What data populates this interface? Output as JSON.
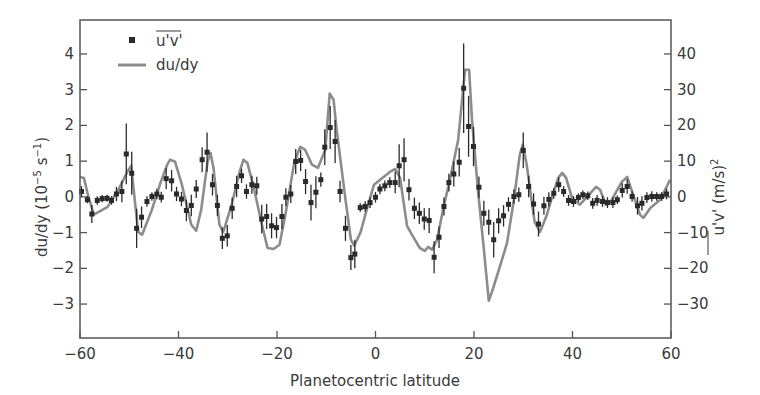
{
  "chart_data": {
    "type": "line",
    "title": "",
    "xlabel": "Planetocentric latitude",
    "ylabel": "du/dy (10^-5 s^-1)",
    "ylabel_right": "u'v' (m/s)^2",
    "xlim": [
      -60,
      60
    ],
    "ylim": [
      -3.95,
      4.95
    ],
    "ylim_right": [
      -39.5,
      49.5
    ],
    "xticks": [
      -60,
      -40,
      -20,
      0,
      20,
      40,
      60
    ],
    "yticks": [
      -3,
      -2,
      -1,
      0,
      1,
      2,
      3,
      4
    ],
    "yticks_right": [
      -30,
      -20,
      -10,
      0,
      10,
      20,
      30,
      40
    ],
    "grid": false,
    "legend_position": "upper left",
    "legend": [
      {
        "label": "u'v'",
        "overline": true,
        "marker": "square",
        "color": "#2a2a2a"
      },
      {
        "label": "du/dy",
        "marker": "line",
        "color": "#8c8c8c"
      }
    ],
    "series": [
      {
        "name": "du/dy",
        "axis": "left",
        "style": "line",
        "color": "#8c8c8c",
        "x": [
          -60,
          -59.2,
          -58.4,
          -57.2,
          -54.4,
          -52,
          -50.4,
          -49.6,
          -48.2,
          -47.4,
          -45.4,
          -43.6,
          -42.3,
          -41.7,
          -40.7,
          -39.3,
          -37.4,
          -36.4,
          -35.4,
          -34.1,
          -33.5,
          -32.9,
          -31.7,
          -30.9,
          -29.2,
          -27.6,
          -26.8,
          -26,
          -24.6,
          -23.1,
          -21.9,
          -20.7,
          -19.5,
          -18.3,
          -16.5,
          -15.3,
          -14.3,
          -12.9,
          -11.7,
          -10.2,
          -9.3,
          -8.5,
          -7.9,
          -6.1,
          -5,
          -4.3,
          -3,
          -1.9,
          -0.3,
          2.9,
          4,
          5,
          6.4,
          7.4,
          9,
          10,
          10.7,
          11.5,
          12.5,
          13.7,
          15.1,
          16.8,
          18.2,
          19,
          19.6,
          20.8,
          22,
          23,
          23.9,
          25.3,
          26.7,
          28.1,
          29.3,
          29.9,
          30.7,
          32.3,
          33.4,
          34.8,
          36,
          37.1,
          37.9,
          38.7,
          39.9,
          41.5,
          44.8,
          45.6,
          46.8,
          48,
          50,
          51.1,
          52.3,
          53.7,
          54.4,
          55.8,
          57.8,
          59,
          59.8
        ],
        "y": [
          0.56,
          0.53,
          0.06,
          -0.5,
          -0.28,
          0.25,
          0.7,
          0.87,
          -0.98,
          -1.06,
          -0.36,
          0.42,
          0.9,
          1.04,
          0.98,
          0.34,
          -0.78,
          -0.95,
          -0.36,
          0.98,
          1.23,
          0.81,
          -0.78,
          -0.98,
          -0.22,
          0.7,
          1.04,
          0.95,
          0.2,
          -0.76,
          -1.43,
          -1.46,
          -1.34,
          -0.5,
          0.95,
          1.4,
          1.32,
          0.9,
          0.81,
          1.32,
          2.89,
          2.72,
          1.88,
          -0.08,
          -1.2,
          -1.37,
          -0.98,
          -0.42,
          0.34,
          0.7,
          0.78,
          0.53,
          -0.81,
          -1.06,
          -1.43,
          -1.51,
          -1.4,
          -1.48,
          -1.2,
          -0.36,
          0.48,
          1.6,
          3.56,
          3.56,
          2.16,
          0.2,
          -1.48,
          -2.91,
          -2.55,
          -1.93,
          -1.29,
          -0.08,
          1.18,
          1.46,
          0.9,
          -0.7,
          -0.98,
          -0.5,
          0.06,
          0.53,
          0.67,
          0.53,
          -0.03,
          -0.22,
          0.28,
          0.2,
          -0.22,
          -0.08,
          0.42,
          0.56,
          0.06,
          -0.5,
          -0.59,
          -0.31,
          -0.08,
          0.25,
          0.48
        ]
      },
      {
        "name": "u'v'",
        "axis": "left",
        "style": "scatter-errorbar",
        "color": "#2a2a2a",
        "x": [
          -59.7,
          -58.5,
          -57.6,
          -56.5,
          -55.5,
          -54.5,
          -53.6,
          -52.6,
          -51.5,
          -50.6,
          -49.5,
          -48.5,
          -47.5,
          -46.4,
          -45.4,
          -44.4,
          -43.5,
          -42.5,
          -41.4,
          -40.4,
          -39.4,
          -38.4,
          -37.4,
          -36.4,
          -35.2,
          -34.2,
          -33.1,
          -32.1,
          -31.1,
          -30.1,
          -29.1,
          -28.2,
          -27.2,
          -26.2,
          -25.1,
          -24.1,
          -23.1,
          -22.1,
          -21.1,
          -20.1,
          -19.0,
          -18.2,
          -17.2,
          -16.2,
          -15.2,
          -14.2,
          -13.1,
          -12.1,
          -11.1,
          -10.3,
          -9.2,
          -8.2,
          -7.2,
          -6.1,
          -5.0,
          -4.2,
          -3.1,
          -2.1,
          -1.1,
          0.0,
          0.9,
          1.9,
          2.9,
          4.0,
          4.8,
          5.8,
          6.8,
          7.9,
          8.9,
          9.9,
          10.9,
          11.9,
          12.9,
          13.9,
          14.9,
          15.9,
          17.0,
          17.9,
          18.9,
          19.9,
          21.0,
          22.0,
          23.0,
          24.0,
          25.0,
          26.0,
          27.0,
          28.1,
          29.1,
          30.0,
          31.1,
          32.1,
          33.1,
          34.2,
          35.2,
          36.2,
          37.2,
          38.2,
          39.2,
          40.2,
          41.2,
          42.1,
          43.1,
          44.1,
          45.0,
          46.1,
          47.1,
          48.2,
          49.1,
          50.1,
          51.1,
          52.1,
          53.2,
          54.1,
          55.1,
          56.1,
          57.1,
          58.1,
          59.1
        ],
        "y": [
          0.15,
          -0.08,
          -0.48,
          -0.1,
          -0.05,
          -0.04,
          -0.1,
          0.08,
          0.15,
          1.2,
          0.66,
          -0.88,
          -0.57,
          -0.13,
          0.01,
          0.08,
          -0.01,
          0.51,
          0.45,
          0.08,
          -0.06,
          -0.38,
          -0.24,
          0.22,
          1.04,
          1.25,
          0.34,
          -0.24,
          -1.16,
          -1.09,
          -0.32,
          0.29,
          0.59,
          0.15,
          0.34,
          0.31,
          -0.62,
          -0.55,
          -0.81,
          -0.86,
          -0.55,
          -0.01,
          0.08,
          0.99,
          1.02,
          0.43,
          -0.16,
          0.13,
          0.48,
          1.39,
          1.94,
          1.55,
          0.15,
          -0.88,
          -1.7,
          -1.6,
          -0.3,
          -0.27,
          -0.16,
          -0.01,
          0.22,
          0.31,
          0.4,
          0.4,
          0.87,
          1.04,
          0.2,
          -0.32,
          -0.46,
          -0.62,
          -0.66,
          -1.69,
          -1.13,
          -0.27,
          0.4,
          0.64,
          0.97,
          3.04,
          1.97,
          1.41,
          0.27,
          -0.46,
          -0.71,
          -1.2,
          -0.67,
          -0.53,
          -0.21,
          0.01,
          0.06,
          1.3,
          0.29,
          -0.2,
          -0.76,
          -0.25,
          -0.07,
          0.1,
          0.34,
          0.15,
          -0.1,
          -0.13,
          -0.02,
          0.06,
          0.03,
          -0.18,
          -0.1,
          -0.13,
          -0.16,
          -0.16,
          -0.08,
          0.18,
          0.29,
          0.01,
          -0.25,
          -0.18,
          -0.02,
          0.01,
          0.01,
          0.01,
          0.08
        ],
        "err": [
          0.15,
          0.1,
          0.25,
          0.12,
          0.1,
          0.1,
          0.12,
          0.2,
          0.3,
          0.85,
          0.6,
          0.55,
          0.3,
          0.15,
          0.12,
          0.15,
          0.15,
          0.3,
          0.3,
          0.2,
          0.2,
          0.3,
          0.3,
          0.25,
          0.35,
          0.55,
          0.3,
          0.3,
          0.3,
          0.3,
          0.3,
          0.3,
          0.2,
          0.2,
          0.25,
          0.25,
          0.4,
          0.35,
          0.35,
          0.3,
          0.35,
          0.25,
          0.25,
          0.35,
          0.3,
          0.35,
          0.5,
          0.45,
          0.2,
          0.5,
          0.6,
          0.6,
          0.3,
          0.35,
          0.35,
          0.4,
          0.12,
          0.15,
          0.15,
          0.15,
          0.15,
          0.15,
          0.15,
          0.3,
          0.6,
          0.6,
          0.3,
          0.3,
          0.3,
          0.3,
          0.35,
          0.45,
          0.3,
          0.25,
          0.25,
          0.35,
          0.4,
          1.25,
          0.85,
          0.55,
          0.3,
          0.35,
          0.35,
          0.5,
          0.35,
          0.3,
          0.2,
          0.2,
          0.2,
          0.5,
          0.3,
          0.3,
          0.35,
          0.25,
          0.2,
          0.15,
          0.2,
          0.15,
          0.15,
          0.15,
          0.12,
          0.12,
          0.12,
          0.15,
          0.15,
          0.15,
          0.15,
          0.15,
          0.12,
          0.2,
          0.2,
          0.15,
          0.25,
          0.2,
          0.15,
          0.15,
          0.12,
          0.12,
          0.15
        ]
      }
    ]
  }
}
